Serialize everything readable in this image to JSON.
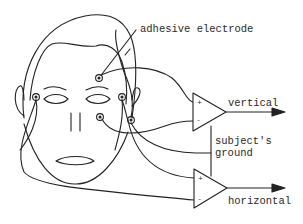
{
  "diagram": {
    "labels": {
      "electrode": "adhesive electrode",
      "vertical": "vertical",
      "ground_line1": "subject's",
      "ground_line2": "ground",
      "horizontal": "horizontal"
    },
    "amplifiers": [
      {
        "name": "vertical-amplifier",
        "plus": "+",
        "minus": "–",
        "output": "vertical"
      },
      {
        "name": "horizontal-amplifier",
        "plus": "+",
        "minus": "–",
        "output": "horizontal"
      }
    ],
    "colors": {
      "stroke": "#222222",
      "background": "#ffffff",
      "text": "#2a2a2a"
    }
  }
}
